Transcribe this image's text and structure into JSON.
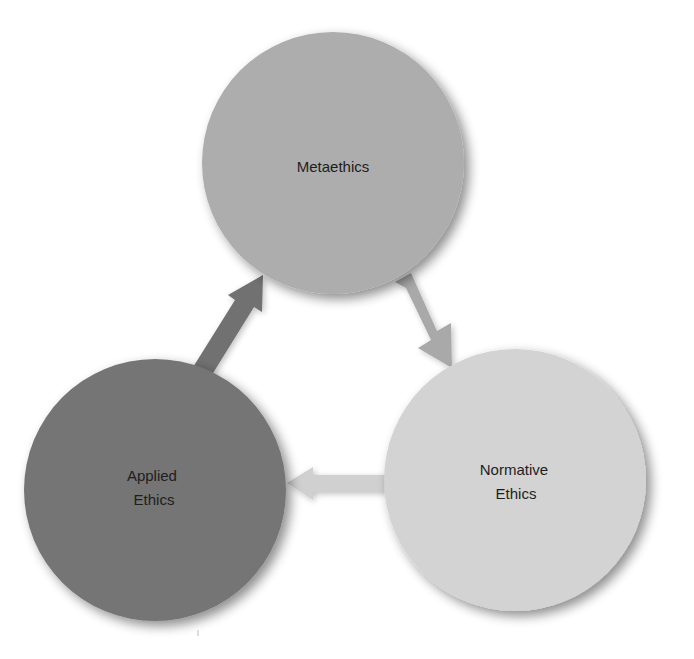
{
  "diagram": {
    "type": "cycle",
    "nodes": [
      {
        "id": "metaethics",
        "label_lines": [
          "Metaethics"
        ],
        "color": "#adadad",
        "cx": 333,
        "cy": 163,
        "r": 131
      },
      {
        "id": "normative",
        "label_lines": [
          "Normative",
          "Ethics"
        ],
        "color": "#d3d3d3",
        "cx": 515,
        "cy": 480,
        "r": 131
      },
      {
        "id": "applied",
        "label_lines": [
          "Applied",
          "Ethics"
        ],
        "color": "#747474",
        "cx": 155,
        "cy": 490,
        "r": 131
      }
    ],
    "edges": [
      {
        "from": "metaethics",
        "to": "normative",
        "color": "#a9a9a9"
      },
      {
        "from": "normative",
        "to": "applied",
        "color": "#d0d0d0"
      },
      {
        "from": "applied",
        "to": "metaethics",
        "color": "#717171"
      }
    ]
  }
}
